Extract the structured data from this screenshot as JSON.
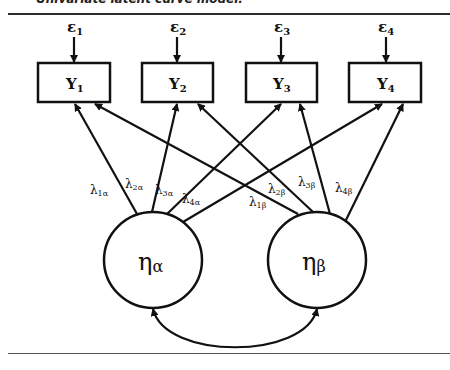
{
  "caption": "Univariate latent curve model.",
  "diagram": {
    "errors": [
      {
        "label": "ε",
        "sub": "1"
      },
      {
        "label": "ε",
        "sub": "2"
      },
      {
        "label": "ε",
        "sub": "3"
      },
      {
        "label": "ε",
        "sub": "4"
      }
    ],
    "observed": [
      {
        "label": "Y",
        "sub": "1"
      },
      {
        "label": "Y",
        "sub": "2"
      },
      {
        "label": "Y",
        "sub": "3"
      },
      {
        "label": "Y",
        "sub": "4"
      }
    ],
    "latent": [
      {
        "label": "η",
        "sub": "α"
      },
      {
        "label": "η",
        "sub": "β"
      }
    ],
    "loadings_alpha": [
      {
        "label": "λ",
        "sub": "1α"
      },
      {
        "label": "λ",
        "sub": "2α"
      },
      {
        "label": "λ",
        "sub": "3α"
      },
      {
        "label": "λ",
        "sub": "4α"
      }
    ],
    "loadings_beta": [
      {
        "label": "λ",
        "sub": "1β"
      },
      {
        "label": "λ",
        "sub": "2β"
      },
      {
        "label": "λ",
        "sub": "3β"
      },
      {
        "label": "λ",
        "sub": "4β"
      }
    ],
    "covariance": "ηα ↔ ηβ"
  }
}
